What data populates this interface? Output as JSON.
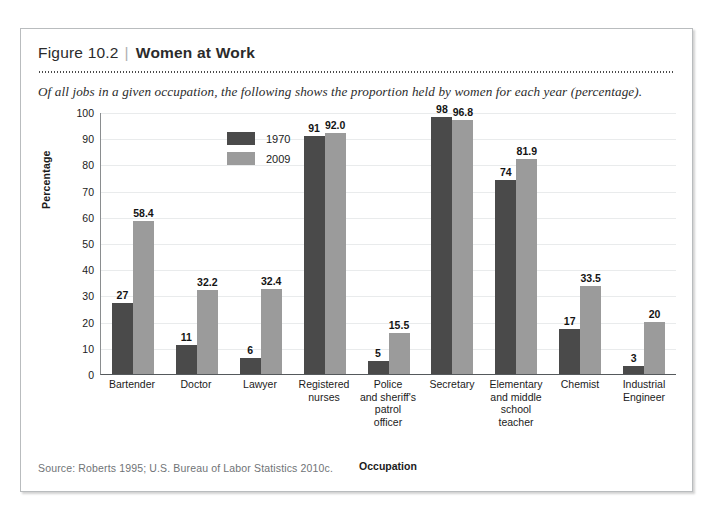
{
  "figure": {
    "number": "Figure 10.2",
    "separator": "|",
    "title": "Women at Work",
    "subtitle": "Of all jobs in a given occupation, the following shows the proportion held by women for each year (percentage).",
    "source": "Source:  Roberts 1995; U.S. Bureau of Labor Statistics 2010c."
  },
  "colors": {
    "series_1970": "#4a4a4a",
    "series_2009": "#9b9b9b",
    "gridline": "#e9ebec",
    "axis": "#55595c",
    "frame_border": "#b9bcbe"
  },
  "chart_data": {
    "type": "bar",
    "title": "Women at Work",
    "subtitle": "Of all jobs in a given occupation, the following shows the proportion held by women for each year (percentage).",
    "xlabel": "Occupation",
    "ylabel": "Percentage",
    "ylim": [
      0,
      100
    ],
    "yticks": [
      0,
      10,
      20,
      30,
      40,
      50,
      60,
      70,
      80,
      90,
      100
    ],
    "grid": true,
    "legend_position": "inside-top-left",
    "categories": [
      "Bartender",
      "Doctor",
      "Lawyer",
      "Registered nurses",
      "Police and sheriff's patrol officer",
      "Secretary",
      "Elementary and middle school teacher",
      "Chemist",
      "Industrial Engineer"
    ],
    "category_lines": [
      [
        "Bartender"
      ],
      [
        "Doctor"
      ],
      [
        "Lawyer"
      ],
      [
        "Registered",
        "nurses"
      ],
      [
        "Police",
        "and sheriff's",
        "patrol",
        "officer"
      ],
      [
        "Secretary"
      ],
      [
        "Elementary",
        "and middle",
        "school",
        "teacher"
      ],
      [
        "Chemist"
      ],
      [
        "Industrial",
        "Engineer"
      ]
    ],
    "series": [
      {
        "name": "1970",
        "color": "#4a4a4a",
        "values": [
          27,
          11,
          6,
          91,
          5,
          98,
          74,
          17,
          3
        ],
        "labels": [
          "27",
          "11",
          "6",
          "91",
          "5",
          "98",
          "74",
          "17",
          "3"
        ]
      },
      {
        "name": "2009",
        "color": "#9b9b9b",
        "values": [
          58.4,
          32.2,
          32.4,
          92.0,
          15.5,
          96.8,
          81.9,
          33.5,
          20
        ],
        "labels": [
          "58.4",
          "32.2",
          "32.4",
          "92.0",
          "15.5",
          "96.8",
          "81.9",
          "33.5",
          "20"
        ]
      }
    ]
  }
}
